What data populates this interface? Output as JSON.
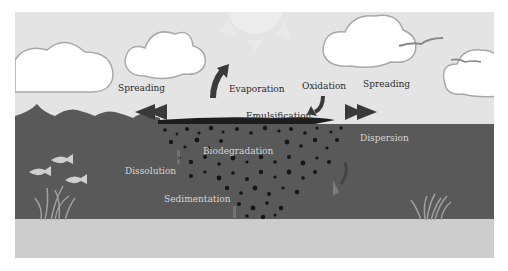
{
  "diagram": {
    "colors": {
      "sky": "#e4e4e4",
      "water": "#595959",
      "seabed": "#cdcdcd",
      "cloud_fill": "#ffffff",
      "cloud_outline": "#a8a8a8",
      "oil": "#1e1e1e",
      "arrow": "#3a3a3a",
      "fish": "#d0d0d0",
      "grass": "#a0a0a0"
    },
    "labels": {
      "spreading_left": "Spreading",
      "evaporation": "Evaporation",
      "oxidation": "Oxidation",
      "spreading_right": "Spreading",
      "emulsification": "Emulsification",
      "dispersion": "Dispersion",
      "biodegradation": "Biodegradation",
      "dissolution": "Dissolution",
      "sedimentation": "Sedimentation"
    },
    "icons": [
      "sun-icon",
      "cloud-icon",
      "bird-icon",
      "fish-icon",
      "seagrass-icon",
      "arrow-icon",
      "oil-droplets-icon"
    ]
  }
}
